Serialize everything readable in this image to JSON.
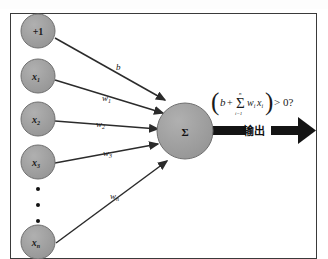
{
  "diagram": {
    "colors": {
      "node_fill": "#9b9b9b",
      "node_stroke": "#6f6f6f",
      "frame": "#3a3a3a",
      "arrow": "#2b2b2b",
      "output_arrow": "#141414",
      "background": "#ffffff",
      "text": "#1a1a1a"
    },
    "input_nodes": [
      {
        "id": "bias",
        "label": "+1",
        "italic": false,
        "sub": "",
        "cx": 38,
        "cy": 31,
        "r": 17
      },
      {
        "id": "x1",
        "label": "x",
        "italic": true,
        "sub": "1",
        "cx": 38,
        "cy": 76,
        "r": 17
      },
      {
        "id": "x2",
        "label": "x",
        "italic": true,
        "sub": "2",
        "cx": 38,
        "cy": 119,
        "r": 17
      },
      {
        "id": "x3",
        "label": "x",
        "italic": true,
        "sub": "3",
        "cx": 38,
        "cy": 162,
        "r": 17
      },
      {
        "id": "xn",
        "label": "x",
        "italic": true,
        "sub": "n",
        "cx": 38,
        "cy": 242,
        "r": 17
      }
    ],
    "ellipsis_dots": [
      {
        "cx": 38,
        "cy": 189
      },
      {
        "cx": 38,
        "cy": 205
      },
      {
        "cx": 38,
        "cy": 221
      }
    ],
    "weight_labels": [
      {
        "id": "b",
        "label": "b",
        "sub": "",
        "x": 116,
        "y": 70
      },
      {
        "id": "w1",
        "label": "w",
        "sub": "1",
        "x": 102,
        "y": 101
      },
      {
        "id": "w2",
        "label": "w",
        "sub": "2",
        "x": 96,
        "y": 127
      },
      {
        "id": "w3",
        "label": "w",
        "sub": "3",
        "x": 103,
        "y": 156
      },
      {
        "id": "wn",
        "label": "w",
        "sub": "n",
        "x": 110,
        "y": 199
      }
    ],
    "edges": [
      {
        "id": "edge-bias",
        "x1": 55,
        "y1": 38,
        "x2": 165,
        "y2": 100
      },
      {
        "id": "edge-x1",
        "x1": 55,
        "y1": 80,
        "x2": 163,
        "y2": 113
      },
      {
        "id": "edge-x2",
        "x1": 55,
        "y1": 121,
        "x2": 158,
        "y2": 129
      },
      {
        "id": "edge-x3",
        "x1": 55,
        "y1": 163,
        "x2": 158,
        "y2": 144
      },
      {
        "id": "edge-xn",
        "x1": 56,
        "y1": 243,
        "x2": 167,
        "y2": 161
      }
    ],
    "summation_node": {
      "id": "sigma",
      "label": "Σ",
      "cx": 185,
      "cy": 131,
      "r": 28
    },
    "output": {
      "arrow_start_x": 206,
      "arrow_end_x": 316,
      "arrow_y": 131,
      "label": "输出",
      "label_x": 254,
      "label_y": 135
    },
    "formula": {
      "open_paren": "(",
      "close_paren": ")",
      "b_term": "b",
      "plus": "+",
      "sigma": "Σ",
      "sum_upper": "n",
      "sum_lower": "i=1",
      "w_term": "w",
      "w_sub": "i",
      "x_term": "x",
      "x_sub": "i",
      "comparison": "> 0?",
      "x": 212,
      "y": 104
    }
  }
}
